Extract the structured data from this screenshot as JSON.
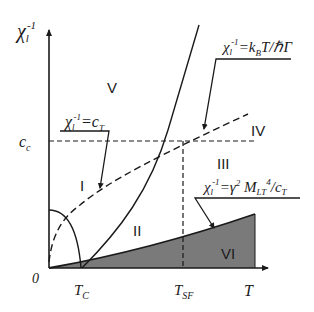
{
  "diagram": {
    "type": "phase-diagram",
    "axes": {
      "y_label": "χ",
      "y_label_sub": "l",
      "y_label_sup": "-1",
      "x_label": "T",
      "origin_label": "0"
    },
    "ticks": {
      "cc_main": "c",
      "cc_sub": "c",
      "tc_main": "T",
      "tc_sub": "C",
      "tsf_main": "T",
      "tsf_sub": "SF"
    },
    "regions": {
      "r1": "I",
      "r2": "II",
      "r3": "III",
      "r4": "IV",
      "r5": "V",
      "r6": "VI"
    },
    "annotations": {
      "a1_chi": "χ",
      "a1_sub": "l",
      "a1_sup": "-1",
      "a1_rhs": "=c",
      "a1_rhs_sub": "T",
      "a2_chi": "χ",
      "a2_sub": "l",
      "a2_sup": "-1",
      "a2_rhs": "=k",
      "a2_rhs_sub": "B",
      "a2_rhs_tail": "T/ℏΓ",
      "a3_chi": "χ",
      "a3_sub": "l",
      "a3_sup": "-1",
      "a3_rhs": "=γ",
      "a3_sup2": "2",
      "a3_m": " M",
      "a3_m_sub": "LT",
      "a3_m_sup": "4",
      "a3_tail": "/c",
      "a3_tail_sub": "T"
    },
    "colors": {
      "line": "#1a1a1a",
      "shade": "#7a7a7a"
    }
  }
}
